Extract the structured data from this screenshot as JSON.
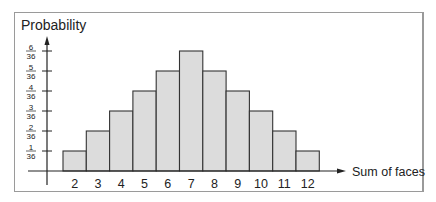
{
  "chart_data": {
    "type": "bar",
    "title": "",
    "ylabel": "Probability",
    "xlabel": "Sum of faces",
    "categories": [
      "2",
      "3",
      "4",
      "5",
      "6",
      "7",
      "8",
      "9",
      "10",
      "11",
      "12"
    ],
    "values_numerator": [
      1,
      2,
      3,
      4,
      5,
      6,
      5,
      4,
      3,
      2,
      1
    ],
    "denominator": 36,
    "values": [
      0.0278,
      0.0556,
      0.0833,
      0.1111,
      0.1389,
      0.1667,
      0.1389,
      0.1111,
      0.0833,
      0.0556,
      0.0278
    ],
    "yticks": [
      {
        "num": "1",
        "den": "36"
      },
      {
        "num": "2",
        "den": "36"
      },
      {
        "num": "3",
        "den": "36"
      },
      {
        "num": "4",
        "den": "36"
      },
      {
        "num": "5",
        "den": "36"
      },
      {
        "num": "6",
        "den": "36"
      }
    ],
    "ylim": [
      0,
      0.1667
    ],
    "grid": false,
    "legend": null
  },
  "colors": {
    "bar_fill": "#dcdcdc",
    "bar_stroke": "#333333",
    "axis": "#222222",
    "frame": "#9a9a9a",
    "text": "#222222"
  }
}
